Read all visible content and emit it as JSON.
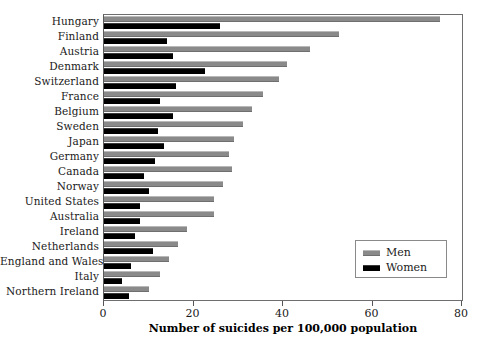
{
  "chart_data": {
    "type": "bar",
    "orientation": "horizontal",
    "title": "",
    "xlabel": "Number of suicides per 100,000 population",
    "ylabel": "",
    "xlim": [
      0,
      80
    ],
    "xticks": [
      0,
      20,
      40,
      60,
      80
    ],
    "xtick_labels": [
      "0",
      "20",
      "40",
      "60",
      "80"
    ],
    "grid": false,
    "legend_position": "lower-right",
    "categories": [
      "Hungary",
      "Finland",
      "Austria",
      "Denmark",
      "Switzerland",
      "France",
      "Belgium",
      "Sweden",
      "Japan",
      "Germany",
      "Canada",
      "Norway",
      "United States",
      "Australia",
      "Ireland",
      "Netherlands",
      "England and Wales",
      "Italy",
      "Northern Ireland"
    ],
    "series": [
      {
        "name": "Men",
        "color": "#8a8a8a",
        "values": [
          75,
          52.5,
          46,
          41,
          39,
          35.5,
          33,
          31,
          29,
          28,
          28.5,
          26.5,
          24.5,
          24.5,
          18.5,
          16.5,
          14.5,
          12.5,
          10
        ]
      },
      {
        "name": "Women",
        "color": "#000000",
        "values": [
          26,
          14,
          15.5,
          22.5,
          16,
          12.5,
          15.5,
          12,
          13.5,
          11.5,
          9,
          10,
          8,
          8,
          7,
          11,
          6,
          4,
          5.5
        ]
      }
    ]
  },
  "legend": {
    "entries": [
      {
        "label": "Men",
        "swatch": "men"
      },
      {
        "label": "Women",
        "swatch": "women"
      }
    ]
  }
}
